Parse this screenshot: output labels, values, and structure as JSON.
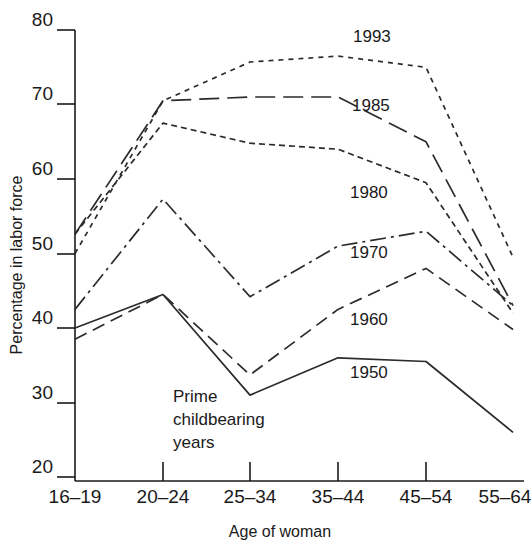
{
  "chart_data": {
    "type": "line",
    "title": "",
    "xlabel": "Age of woman",
    "ylabel": "Percentage in labor force",
    "categories": [
      "16–19",
      "20–24",
      "25–34",
      "35–44",
      "45–54",
      "55–64"
    ],
    "ylim": [
      20,
      80
    ],
    "yticks": [
      20,
      30,
      40,
      50,
      60,
      70,
      80
    ],
    "ytick_labels": [
      "20",
      "30",
      "40",
      "50",
      "60",
      "70",
      "80"
    ],
    "grid": false,
    "legend": "inline-right-of-series",
    "series": [
      {
        "name": "1950",
        "label": "1950",
        "style": "solid",
        "values": [
          40.0,
          44.5,
          31.0,
          36.0,
          35.5,
          26.0
        ]
      },
      {
        "name": "1960",
        "label": "1960",
        "style": "dashed",
        "values": [
          38.5,
          44.5,
          33.7,
          42.5,
          48.0,
          39.8
        ]
      },
      {
        "name": "1970",
        "label": "1970",
        "style": "dash-dot",
        "values": [
          42.5,
          57.3,
          44.2,
          51.0,
          53.0,
          43.0
        ]
      },
      {
        "name": "1980",
        "label": "1980",
        "style": "fine-dash",
        "values": [
          52.6,
          67.5,
          64.8,
          64.0,
          59.5,
          42.0
        ]
      },
      {
        "name": "1985",
        "label": "1985",
        "style": "long-dash",
        "values": [
          52.6,
          70.5,
          71.0,
          71.0,
          65.0,
          43.0
        ]
      },
      {
        "name": "1993",
        "label": "1993",
        "style": "dotted",
        "values": [
          50.0,
          70.5,
          75.7,
          76.5,
          75.0,
          49.5
        ]
      }
    ],
    "annotations": [
      {
        "name": "prime-childbearing-years",
        "lines": [
          "Prime",
          "childbearing",
          "years"
        ]
      }
    ]
  }
}
